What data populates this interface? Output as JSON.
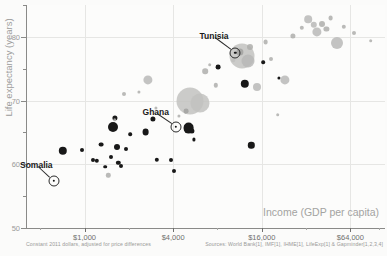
{
  "chart_data": {
    "type": "scatter",
    "title": "",
    "subtitle": "",
    "xlabel": "Income (GDP per capita)",
    "ylabel": "Life expectancy (years)",
    "x_scale": "log",
    "xlim": [
      400,
      110000
    ],
    "ylim": [
      50,
      85
    ],
    "grid": true,
    "legend_position": "none",
    "x_ticks": [
      {
        "value": 1000,
        "label": "$1,000"
      },
      {
        "value": 4000,
        "label": "$4,000"
      },
      {
        "value": 16000,
        "label": "$16,000"
      },
      {
        "value": 64000,
        "label": "$64,000"
      }
    ],
    "y_ticks": [
      {
        "value": 80,
        "label": "80"
      },
      {
        "value": 70,
        "label": "70"
      },
      {
        "value": 60,
        "label": "60"
      },
      {
        "value": 50,
        "label": "50"
      }
    ],
    "y_minor_ticks": [
      85,
      75,
      65,
      55
    ],
    "series": [
      {
        "name": "Highlighted region",
        "color": "#181818",
        "points": [
          {
            "x": 710,
            "y": 62.1,
            "r": 4.2
          },
          {
            "x": 960,
            "y": 62.3,
            "r": 2.0
          },
          {
            "x": 1140,
            "y": 60.6,
            "r": 2.0
          },
          {
            "x": 1210,
            "y": 60.5,
            "r": 2.2
          },
          {
            "x": 1290,
            "y": 63.1,
            "r": 2.4
          },
          {
            "x": 1380,
            "y": 59.6,
            "r": 1.8
          },
          {
            "x": 1520,
            "y": 61.2,
            "r": 2.0
          },
          {
            "x": 1560,
            "y": 65.9,
            "r": 5.0
          },
          {
            "x": 1600,
            "y": 67.3,
            "r": 2.6
          },
          {
            "x": 1660,
            "y": 62.7,
            "r": 3.0
          },
          {
            "x": 1700,
            "y": 60.2,
            "r": 2.2
          },
          {
            "x": 1760,
            "y": 59.7,
            "r": 2.0
          },
          {
            "x": 1900,
            "y": 62.4,
            "r": 2.0
          },
          {
            "x": 2050,
            "y": 64.7,
            "r": 1.8
          },
          {
            "x": 2600,
            "y": 65.0,
            "r": 3.4
          },
          {
            "x": 2900,
            "y": 67.1,
            "r": 2.6
          },
          {
            "x": 3100,
            "y": 60.7,
            "r": 2.2
          },
          {
            "x": 3850,
            "y": 60.6,
            "r": 2.0
          },
          {
            "x": 4050,
            "y": 59.0,
            "r": 2.0
          },
          {
            "x": 4900,
            "y": 68.4,
            "r": 2.4
          },
          {
            "x": 5100,
            "y": 65.7,
            "r": 5.4
          },
          {
            "x": 5350,
            "y": 65.2,
            "r": 2.6
          },
          {
            "x": 5500,
            "y": 63.9,
            "r": 1.6
          },
          {
            "x": 8100,
            "y": 75.2,
            "r": 2.4
          },
          {
            "x": 11400,
            "y": 77.6,
            "r": 3.6
          },
          {
            "x": 12300,
            "y": 72.6,
            "r": 4.2
          },
          {
            "x": 13600,
            "y": 63.0,
            "r": 3.2
          },
          {
            "x": 16400,
            "y": 76.0,
            "r": 1.8
          },
          {
            "x": 21000,
            "y": 73.6,
            "r": 1.6
          }
        ]
      },
      {
        "name": "Other regions",
        "color": "#b9b9b7",
        "points": [
          {
            "x": 1450,
            "y": 58.3,
            "r": 2.2
          },
          {
            "x": 1600,
            "y": 67.0,
            "r": 1.8
          },
          {
            "x": 1850,
            "y": 71.1,
            "r": 2.0
          },
          {
            "x": 2350,
            "y": 71.3,
            "r": 1.6
          },
          {
            "x": 2700,
            "y": 73.2,
            "r": 4.6
          },
          {
            "x": 3050,
            "y": 68.9,
            "r": 1.6
          },
          {
            "x": 4400,
            "y": 67.6,
            "r": 1.6
          },
          {
            "x": 5200,
            "y": 69.9,
            "r": 13.5
          },
          {
            "x": 6100,
            "y": 69.6,
            "r": 9.5
          },
          {
            "x": 6600,
            "y": 74.6,
            "r": 2.8
          },
          {
            "x": 7100,
            "y": 75.6,
            "r": 1.8
          },
          {
            "x": 7800,
            "y": 72.4,
            "r": 2.2
          },
          {
            "x": 10200,
            "y": 76.3,
            "r": 1.8
          },
          {
            "x": 11800,
            "y": 77.0,
            "r": 12.5
          },
          {
            "x": 12800,
            "y": 76.2,
            "r": 6.5
          },
          {
            "x": 13400,
            "y": 78.4,
            "r": 3.0
          },
          {
            "x": 14900,
            "y": 72.2,
            "r": 4.0
          },
          {
            "x": 17000,
            "y": 79.2,
            "r": 2.4
          },
          {
            "x": 18500,
            "y": 76.6,
            "r": 2.0
          },
          {
            "x": 20500,
            "y": 67.8,
            "r": 1.8
          },
          {
            "x": 23000,
            "y": 73.2,
            "r": 4.6
          },
          {
            "x": 26000,
            "y": 80.1,
            "r": 2.6
          },
          {
            "x": 30000,
            "y": 81.4,
            "r": 2.2
          },
          {
            "x": 33000,
            "y": 82.8,
            "r": 3.8
          },
          {
            "x": 36000,
            "y": 81.9,
            "r": 3.2
          },
          {
            "x": 38000,
            "y": 80.8,
            "r": 4.6
          },
          {
            "x": 41000,
            "y": 82.0,
            "r": 3.0
          },
          {
            "x": 44000,
            "y": 81.2,
            "r": 2.6
          },
          {
            "x": 47000,
            "y": 83.0,
            "r": 2.4
          },
          {
            "x": 52000,
            "y": 79.1,
            "r": 6.0
          },
          {
            "x": 58000,
            "y": 81.6,
            "r": 2.2
          },
          {
            "x": 68000,
            "y": 80.6,
            "r": 2.0
          },
          {
            "x": 88000,
            "y": 79.4,
            "r": 1.8
          }
        ]
      }
    ],
    "annotations": [
      {
        "label": "Somalia",
        "x": 620,
        "y": 57.4,
        "label_dx": -34,
        "label_dy": -16
      },
      {
        "label": "Ghana",
        "x": 4150,
        "y": 65.9,
        "label_dx": -33,
        "label_dy": -15
      },
      {
        "label": "Tunisia",
        "x": 10600,
        "y": 77.5,
        "label_dx": -36,
        "label_dy": -17
      }
    ]
  },
  "footer": {
    "left": "Constant 2011 dollars, adjusted for price differences",
    "right": "Sources: World Bank[1], IMF[1], IHME[1], LifeExp[1] & Gapminder[1,2,3,4]"
  }
}
